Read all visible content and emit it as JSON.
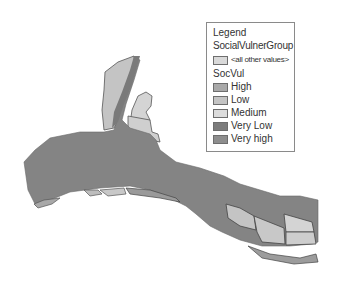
{
  "legend": {
    "title": "Legend",
    "layer": "SocialVulnerGroup",
    "other_values": {
      "label": "<all other values>",
      "color": "#d9d9d9"
    },
    "field": "SocVul",
    "classes": [
      {
        "label": "High",
        "color": "#a9a9a9"
      },
      {
        "label": "Low",
        "color": "#c4c4c4"
      },
      {
        "label": "Medium",
        "color": "#dcdcdc"
      },
      {
        "label": "Very Low",
        "color": "#7c7c7c"
      },
      {
        "label": "Very high",
        "color": "#8e8e8e"
      }
    ]
  },
  "map": {
    "base_fill": "#848484",
    "light_fill": "#c8c8c8",
    "medium_fill": "#b4b4b4",
    "outline": "#555555"
  }
}
